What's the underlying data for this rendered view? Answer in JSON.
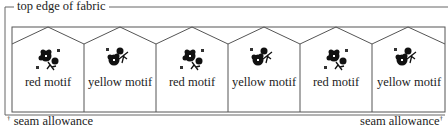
{
  "diagram": {
    "top_label": "top edge of fabric",
    "seam_left_label": "seam allowance",
    "seam_right_label": "seam allowance",
    "seam_marker": "†",
    "line_color": "#555555",
    "motif_color": "#111111",
    "panels": [
      {
        "label": "red motif"
      },
      {
        "label": "yellow motif"
      },
      {
        "label": "red motif"
      },
      {
        "label": "yellow motif"
      },
      {
        "label": "red motif"
      },
      {
        "label": "yellow motif"
      }
    ]
  }
}
